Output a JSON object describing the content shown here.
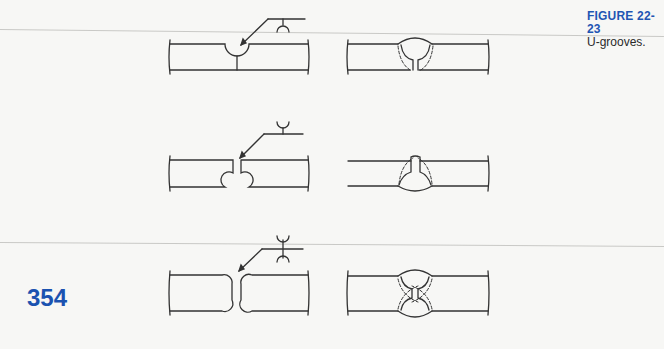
{
  "figure": {
    "number": "FIGURE 22-23",
    "title": "U-grooves."
  },
  "page": {
    "number": "354"
  },
  "colors": {
    "accent_blue": "#1f55b3",
    "line": "#333333",
    "paper": "#f7f7f5"
  },
  "rows": [
    {
      "name": "single-u-groove-square-root",
      "left_joint": "single U-groove prepared joint with weld symbol (U below reference line)",
      "right_joint": "completed single U-groove weld with dashed fusion outline"
    },
    {
      "name": "single-u-groove-other-side",
      "left_joint": "U-groove on bottom side with weld symbol (U above reference line)",
      "right_joint": "completed U-groove weld from bottom side"
    },
    {
      "name": "double-u-groove",
      "left_joint": "double U-groove prepared joint with double U weld symbol",
      "right_joint": "completed double U-groove weld"
    }
  ]
}
